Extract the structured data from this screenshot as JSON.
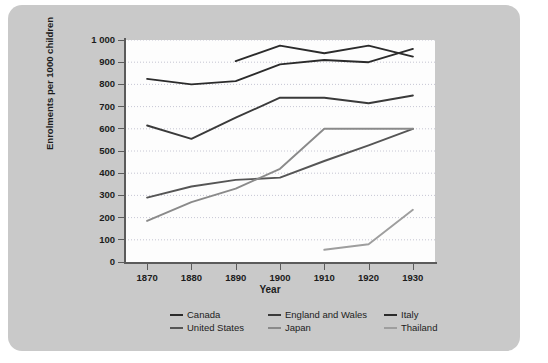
{
  "chart_data": {
    "type": "line",
    "title": "",
    "xlabel": "Year",
    "ylabel": "Enrolments per 1000 children",
    "x": [
      1870,
      1880,
      1890,
      1900,
      1910,
      1920,
      1930
    ],
    "xlim": [
      1865,
      1935
    ],
    "ylim": [
      0,
      1000
    ],
    "ytick_labels": [
      "0",
      "100",
      "200",
      "300",
      "400",
      "500",
      "600",
      "700",
      "800",
      "900",
      "1 000"
    ],
    "ytick_values": [
      0,
      100,
      200,
      300,
      400,
      500,
      600,
      700,
      800,
      900,
      1000
    ],
    "xtick_labels": [
      "1870",
      "1880",
      "1890",
      "1900",
      "1910",
      "1920",
      "1930"
    ],
    "grid": true,
    "legend_position": "bottom",
    "series": [
      {
        "name": "Canada",
        "color": "#2b2b2b",
        "x": [
          1870,
          1880,
          1890,
          1900,
          1910,
          1920,
          1930
        ],
        "values": [
          825,
          800,
          815,
          890,
          910,
          900,
          960
        ]
      },
      {
        "name": "England and Wales",
        "color": "#3a3a3a",
        "x": [
          1870,
          1880,
          1890,
          1900,
          1910,
          1920,
          1930
        ],
        "values": [
          615,
          555,
          650,
          740,
          740,
          715,
          750
        ]
      },
      {
        "name": "Italy",
        "color": "#2b2b2b",
        "x": [
          1890,
          1900,
          1910,
          1920,
          1930
        ],
        "values": [
          905,
          975,
          940,
          975,
          925
        ]
      },
      {
        "name": "United States",
        "color": "#555555",
        "x": [
          1870,
          1880,
          1890,
          1900,
          1910,
          1920,
          1930
        ],
        "values": [
          290,
          340,
          370,
          380,
          455,
          525,
          600
        ]
      },
      {
        "name": "Japan",
        "color": "#8a8a8a",
        "x": [
          1870,
          1880,
          1890,
          1900,
          1910,
          1920,
          1930
        ],
        "values": [
          185,
          270,
          330,
          420,
          600,
          600,
          600
        ]
      },
      {
        "name": "Thailand",
        "color": "#9e9e9e",
        "x": [
          1910,
          1920,
          1930
        ],
        "values": [
          55,
          80,
          235
        ]
      }
    ]
  },
  "legend": {
    "items": [
      {
        "label": "Canada",
        "color": "#2b2b2b"
      },
      {
        "label": "England and Wales",
        "color": "#3a3a3a"
      },
      {
        "label": "Italy",
        "color": "#2b2b2b"
      },
      {
        "label": "United States",
        "color": "#555555"
      },
      {
        "label": "Japan",
        "color": "#8a8a8a"
      },
      {
        "label": "Thailand",
        "color": "#9e9e9e"
      }
    ]
  },
  "colors": {
    "panel_background": "#c9c9c9",
    "plot_background": "#fdfdfd",
    "axis": "#5b5b5b",
    "grid": "#b8b8c8",
    "text": "#1c1c1c"
  }
}
